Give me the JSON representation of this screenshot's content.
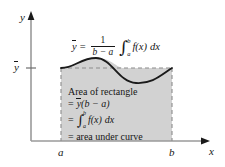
{
  "figure": {
    "axes": {
      "y_label": "y",
      "x_label": "x",
      "ybar_tick_label": "y",
      "a_tick_label": "a",
      "b_tick_label": "b"
    },
    "main_formula": {
      "lhs": "y",
      "equals": "=",
      "fraction_numerator": "1",
      "fraction_denominator": "b − a",
      "integral_sign": "∫",
      "integral_upper": "b",
      "integral_lower": "a",
      "integrand": "f(x)",
      "differential": "dx",
      "plain": "ȳ = 1/(b − a) ∫ₐᵇ f(x) dx"
    },
    "annotation": {
      "line1": "Area of rectangle",
      "line2_eq": "=",
      "line2_ybar": "y",
      "line2_rest": "(b − a)",
      "line3_eq": "=",
      "line3_integral_sign": "∫",
      "line3_upper": "b",
      "line3_lower": "a",
      "line3_integrand": "f(x)",
      "line3_differential": "dx",
      "line4": "= area under curve"
    },
    "colors": {
      "shading": "#d2d2d2",
      "curve": "#1a1a1a",
      "axis": "#9a9a9a",
      "dashed": "#8c8c8c",
      "text": "#161616",
      "background": "#ffffff"
    },
    "geometry": {
      "a_x": 61,
      "b_x": 172,
      "ybar_y": 68,
      "baseline_y": 141,
      "curve_description": "rises from ybar at a to a peak, dips to a trough, returns to ybar at b"
    }
  }
}
